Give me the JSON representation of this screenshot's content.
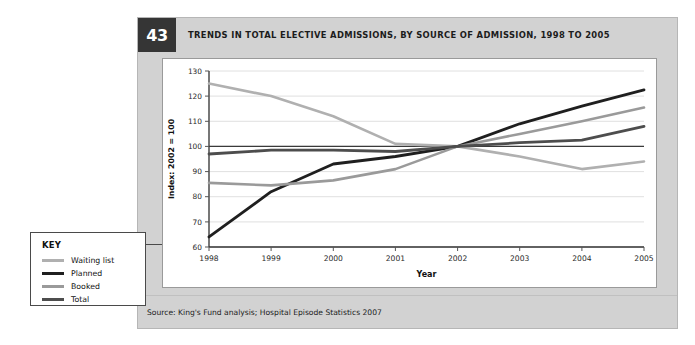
{
  "figure": {
    "number": "43",
    "title": "TRENDS IN TOTAL ELECTIVE ADMISSIONS, BY SOURCE OF ADMISSION, 1998 TO 2005",
    "source": "Source: King's Fund analysis; Hospital Episode Statistics 2007"
  },
  "key": {
    "title": "KEY",
    "items": [
      {
        "label": "Waiting list",
        "color": "#b0b0b0"
      },
      {
        "label": "Planned",
        "color": "#1f1f1f"
      },
      {
        "label": "Booked",
        "color": "#9a9a9a"
      },
      {
        "label": "Total",
        "color": "#4d4d4d"
      }
    ]
  },
  "chart_data": {
    "type": "line",
    "title": "TRENDS IN TOTAL ELECTIVE ADMISSIONS, BY SOURCE OF ADMISSION, 1998 TO 2005",
    "xlabel": "Year",
    "ylabel": "Index: 2002 = 100",
    "categories": [
      "1998",
      "1999",
      "2000",
      "2001",
      "2002",
      "2003",
      "2004",
      "2005"
    ],
    "x": [
      1998,
      1999,
      2000,
      2001,
      2002,
      2003,
      2004,
      2005
    ],
    "ylim": [
      60,
      130
    ],
    "yticks": [
      60,
      70,
      80,
      90,
      100,
      110,
      120,
      130
    ],
    "grid": true,
    "legend_position": "external-left",
    "reference_line": 100,
    "series": [
      {
        "name": "Waiting list",
        "color": "#b0b0b0",
        "width": 2.6,
        "values": [
          125,
          120,
          112,
          101,
          100,
          96,
          91,
          94
        ]
      },
      {
        "name": "Planned",
        "color": "#1f1f1f",
        "width": 2.8,
        "values": [
          64,
          82,
          93,
          96,
          100,
          109,
          116,
          122.5
        ]
      },
      {
        "name": "Booked",
        "color": "#9a9a9a",
        "width": 2.6,
        "values": [
          85.5,
          84.5,
          86.5,
          91,
          100,
          105,
          110,
          115.5
        ]
      },
      {
        "name": "Total",
        "color": "#4d4d4d",
        "width": 2.8,
        "values": [
          97,
          98.5,
          98.5,
          98,
          100,
          101.5,
          102.5,
          108
        ]
      }
    ]
  }
}
